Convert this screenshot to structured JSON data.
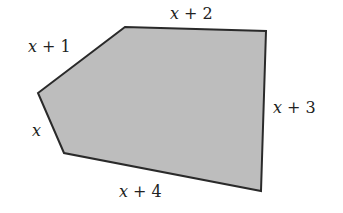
{
  "figure": {
    "shape": "pentagon",
    "fill_color": "#bdbdbd",
    "stroke_color": "#2a2a2a",
    "vertices": [
      [
        125,
        27
      ],
      [
        266,
        31
      ],
      [
        261,
        191
      ],
      [
        64,
        153
      ],
      [
        38,
        93
      ]
    ],
    "side_labels": [
      {
        "id": "top-left",
        "var": "x",
        "rest": " + 1",
        "x": 28,
        "y": 52
      },
      {
        "id": "top",
        "var": "x",
        "rest": " + 2",
        "x": 170,
        "y": 19
      },
      {
        "id": "right",
        "var": "x",
        "rest": " + 3",
        "x": 273,
        "y": 113
      },
      {
        "id": "bottom",
        "var": "x",
        "rest": " + 4",
        "x": 119,
        "y": 197
      },
      {
        "id": "left",
        "var": "x",
        "rest": "",
        "x": 32,
        "y": 136
      }
    ]
  }
}
